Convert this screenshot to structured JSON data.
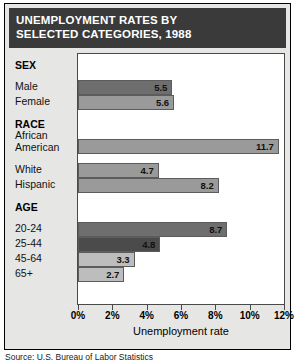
{
  "figure": {
    "title_line1": "UNEMPLOYMENT RATES BY",
    "title_line2": "SELECTED CATEGORIES, 1988",
    "source_note": "Source: U.S. Bureau of Labor Statistics"
  },
  "chart_data": {
    "type": "bar",
    "orientation": "horizontal",
    "title": "UNEMPLOYMENT RATES BY SELECTED CATEGORIES, 1988",
    "xlabel": "Unemployment rate",
    "ylabel": "",
    "xlim": [
      0,
      12
    ],
    "xticks": [
      0,
      2,
      4,
      6,
      8,
      10,
      12
    ],
    "xticklabels": [
      "0%",
      "2%",
      "4%",
      "6%",
      "8%",
      "10%",
      "12%"
    ],
    "grid": false,
    "legend": false,
    "value_suffix": "%",
    "groups": [
      {
        "name": "SEX",
        "items": [
          {
            "label": "Male",
            "label_lines": [
              "Male"
            ],
            "value": 5.5,
            "value_label": "5.5",
            "shade": "shade-dark"
          },
          {
            "label": "Female",
            "label_lines": [
              "Female"
            ],
            "value": 5.6,
            "value_label": "5.6",
            "shade": "shade-mid"
          }
        ]
      },
      {
        "name": "RACE",
        "items": [
          {
            "label": "African American",
            "label_lines": [
              "African",
              "American"
            ],
            "value": 11.7,
            "value_label": "11.7",
            "shade": "shade-mid"
          },
          {
            "label": "White",
            "label_lines": [
              "White"
            ],
            "value": 4.7,
            "value_label": "4.7",
            "shade": "shade-mid"
          },
          {
            "label": "Hispanic",
            "label_lines": [
              "Hispanic"
            ],
            "value": 8.2,
            "value_label": "8.2",
            "shade": "shade-mid"
          }
        ]
      },
      {
        "name": "AGE",
        "items": [
          {
            "label": "20-24",
            "label_lines": [
              "20-24"
            ],
            "value": 8.7,
            "value_label": "8.7",
            "shade": "shade-dark"
          },
          {
            "label": "25-44",
            "label_lines": [
              "25-44"
            ],
            "value": 4.8,
            "value_label": "4.8",
            "shade": "shade-xdark"
          },
          {
            "label": "45-64",
            "label_lines": [
              "45-64"
            ],
            "value": 3.3,
            "value_label": "3.3",
            "shade": "shade-light"
          },
          {
            "label": "65+",
            "label_lines": [
              "65+"
            ],
            "value": 2.7,
            "value_label": "2.7",
            "shade": "shade-light"
          }
        ]
      }
    ]
  }
}
